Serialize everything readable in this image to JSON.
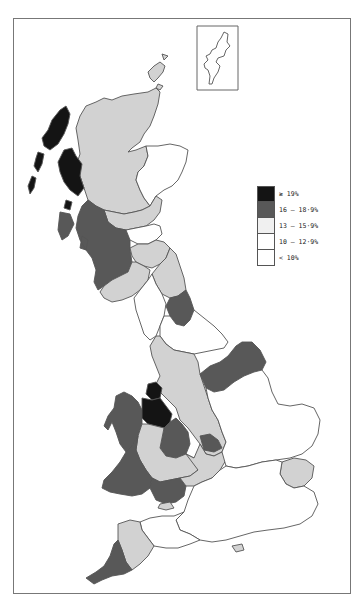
{
  "figure": {
    "type": "choropleth-map",
    "page_number": ""
  },
  "colors": {
    "ge19": "#141414",
    "16_18_9": "#585858",
    "13_15_9": "#d2d2d2",
    "10_12_9": "#ffffff",
    "lt10": "#ffffff",
    "outline": "#555555",
    "frame": "#777777"
  },
  "legend": {
    "items": [
      {
        "label": "≥ 19%",
        "class": "ge19"
      },
      {
        "label": "16 – 18·9%",
        "class": "16_18_9"
      },
      {
        "label": "13 – 15·9%",
        "class": "13_15_9"
      },
      {
        "label": "10 – 12·9%",
        "class": "10_12_9"
      },
      {
        "label": "< 10%",
        "class": "lt10"
      }
    ]
  },
  "regions": [
    {
      "name": "Shetland (inset)",
      "class": "lt10"
    },
    {
      "name": "Orkney",
      "class": "13_15_9"
    },
    {
      "name": "Highlands",
      "class": "13_15_9"
    },
    {
      "name": "Western Isles",
      "class": "ge19"
    },
    {
      "name": "Skye / Lochaber islands",
      "class": "ge19"
    },
    {
      "name": "Grampian",
      "class": "lt10"
    },
    {
      "name": "Tayside",
      "class": "13_15_9"
    },
    {
      "name": "Fife",
      "class": "13_15_9"
    },
    {
      "name": "Strathclyde",
      "class": "16_18_9"
    },
    {
      "name": "Central / Lothian",
      "class": "10_12_9"
    },
    {
      "name": "Borders",
      "class": "13_15_9"
    },
    {
      "name": "Dumfries & Galloway",
      "class": "13_15_9"
    },
    {
      "name": "Northumberland",
      "class": "13_15_9"
    },
    {
      "name": "Cumbria",
      "class": "lt10"
    },
    {
      "name": "Tyne & Wear / Durham",
      "class": "16_18_9"
    },
    {
      "name": "North Yorkshire",
      "class": "lt10"
    },
    {
      "name": "Lancashire / Greater Manchester",
      "class": "13_15_9"
    },
    {
      "name": "Merseyside",
      "class": "ge19"
    },
    {
      "name": "Humberside / South Yorkshire",
      "class": "16_18_9"
    },
    {
      "name": "Gwynedd",
      "class": "16_18_9"
    },
    {
      "name": "Clwyd",
      "class": "ge19"
    },
    {
      "name": "Cheshire / Staffordshire",
      "class": "13_15_9"
    },
    {
      "name": "West Midlands",
      "class": "16_18_9"
    },
    {
      "name": "Leicestershire",
      "class": "16_18_9"
    },
    {
      "name": "Powys",
      "class": "13_15_9"
    },
    {
      "name": "Dyfed",
      "class": "16_18_9"
    },
    {
      "name": "Glamorgan / Gwent",
      "class": "16_18_9"
    },
    {
      "name": "Hereford & Worcester",
      "class": "13_15_9"
    },
    {
      "name": "East Anglia",
      "class": "lt10"
    },
    {
      "name": "South East",
      "class": "lt10"
    },
    {
      "name": "Essex",
      "class": "13_15_9"
    },
    {
      "name": "Isle of Wight",
      "class": "13_15_9"
    },
    {
      "name": "Devon",
      "class": "13_15_9"
    },
    {
      "name": "Cornwall",
      "class": "16_18_9"
    },
    {
      "name": "South West (Somerset/Dorset/Wilts)",
      "class": "lt10"
    },
    {
      "name": "Avon bay area",
      "class": "13_15_9"
    }
  ]
}
